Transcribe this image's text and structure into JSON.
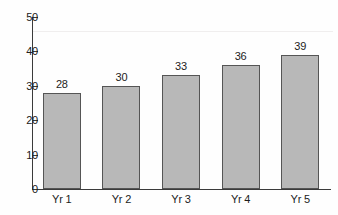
{
  "chart_data": {
    "type": "bar",
    "title": "",
    "subtitle": "",
    "xlabel": "",
    "ylabel": "",
    "categories": [
      "Yr 1",
      "Yr 2",
      "Yr 3",
      "Yr 4",
      "Yr 5"
    ],
    "values": [
      28,
      30,
      33,
      36,
      39
    ],
    "value_labels": [
      "28",
      "30",
      "33",
      "36",
      "39"
    ],
    "ylim": [
      0,
      50
    ],
    "y_ticks": [
      0,
      10,
      20,
      30,
      40,
      50
    ],
    "y_tick_labels": [
      "0",
      "10",
      "20",
      "30",
      "40",
      "50"
    ],
    "grid": false,
    "legend": null,
    "legend_position": "none",
    "bar_fill_color": "#b8b8b8",
    "bar_border_color": "#555555",
    "axis_color": "#3b3b3b",
    "text_color": "#1c1c1c",
    "background_color": "#fefefe"
  }
}
